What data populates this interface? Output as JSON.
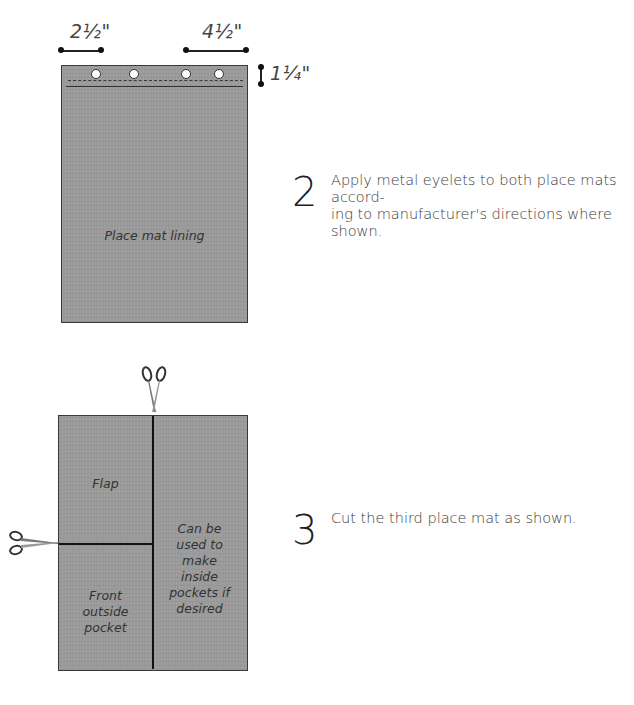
{
  "figure1": {
    "dimensions": {
      "left_width": "2½\"",
      "right_width": "4½\"",
      "hem_depth": "1¼\""
    },
    "mat_label": "Place mat lining",
    "eyelet_count": 4,
    "mat_color": "#9a9a9a"
  },
  "figure2": {
    "sections": {
      "flap": "Flap",
      "front_pocket": "Front\noutside\npocket",
      "inside_pockets": "Can be\nused to\nmake\ninside\npockets if\ndesired"
    },
    "icons": [
      "scissors-icon-top",
      "scissors-icon-left"
    ]
  },
  "steps": [
    {
      "number": "2",
      "text": "Apply metal eyelets to both place mats accord-\ning to manufacturer's directions where shown."
    },
    {
      "number": "3",
      "text": "Cut the third place mat as shown."
    }
  ]
}
